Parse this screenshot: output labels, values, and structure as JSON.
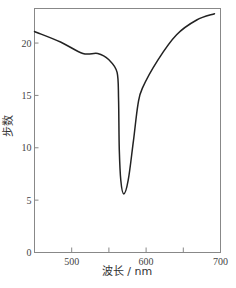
{
  "chart_data": {
    "type": "line",
    "title": "",
    "xlabel": "波长 / nm",
    "ylabel": "步数",
    "xlim": [
      450,
      700
    ],
    "ylim": [
      0,
      23.3
    ],
    "x_ticks": [
      500,
      550,
      600,
      650,
      700
    ],
    "x_tick_labels": [
      "500",
      "",
      "600",
      "",
      "700"
    ],
    "y_ticks": [
      0,
      5,
      10,
      15,
      20
    ],
    "y_tick_labels": [
      "0",
      "5",
      "10",
      "15",
      "20"
    ],
    "grid": false,
    "legend": null,
    "series": [
      {
        "name": "步数",
        "x": [
          450,
          485,
          515,
          535,
          550,
          561,
          563,
          564,
          566,
          570,
          576,
          583,
          589,
          595,
          616,
          641,
          668,
          692
        ],
        "y": [
          21.1,
          20.1,
          19.0,
          19.0,
          18.4,
          17.2,
          14.5,
          9.8,
          6.9,
          5.6,
          6.9,
          10.7,
          14.1,
          15.7,
          18.4,
          20.8,
          22.2,
          22.8
        ]
      }
    ],
    "annotations": []
  },
  "colors": {
    "line": "#222222",
    "frame": "#888888",
    "text": "#444444"
  }
}
